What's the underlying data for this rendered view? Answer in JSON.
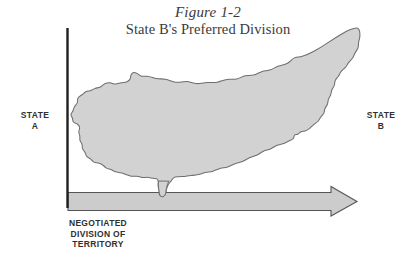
{
  "figure": {
    "title_line1": "Figure 1-2",
    "title_line2": "State B's Preferred Division"
  },
  "labels": {
    "state_a": "STATE\nA",
    "state_b": "STATE\nB",
    "axis_caption": "NEGOTIATED\nDIVISION OF\nTERRITORY"
  },
  "colors": {
    "background": "#ffffff",
    "island_fill": "#d2d2d2",
    "island_stroke": "#6e6e6e",
    "arrow_fill": "#cccccc",
    "arrow_stroke": "#555555",
    "divider_line": "#1f1f1f",
    "text": "#303030",
    "title_text": "#3a3a3a"
  },
  "geometry": {
    "divider_x": 67,
    "divider_y_top": 28,
    "divider_y_bottom": 208,
    "arrow_y_top": 192,
    "arrow_y_bottom": 211,
    "arrow_x_start": 68,
    "arrow_tip_x": 357
  }
}
